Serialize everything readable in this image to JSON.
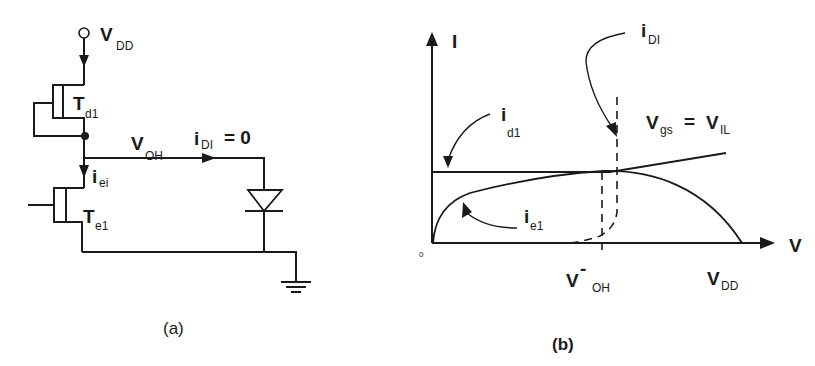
{
  "figure_a": {
    "caption": "(a)",
    "vdd": {
      "main": "V",
      "sub": "DD"
    },
    "td1": {
      "main": "T",
      "sub": "d1"
    },
    "te1": {
      "main": "T",
      "sub": "e1"
    },
    "iei": {
      "main": "i",
      "sub": "ei"
    },
    "voh": {
      "main": "V",
      "sub": "OH"
    },
    "idi_eq": {
      "main": "i",
      "sub": "DI",
      "rest": "=  0"
    }
  },
  "figure_b": {
    "caption": "(b)",
    "y_axis_label": "I",
    "x_axis_label": "V",
    "origin_label": "0",
    "id1": {
      "main": "i",
      "sub": "d1"
    },
    "ie1": {
      "main": "i",
      "sub": "e1"
    },
    "idi": {
      "main": "i",
      "sub": "DI"
    },
    "vgs": {
      "main": "V",
      "sub": "gs",
      "eq": "=",
      "rhs_main": "V",
      "rhs_sub": "IL"
    },
    "voh_minus": {
      "main": "V",
      "sup": "-",
      "sub": "OH"
    },
    "vdd": {
      "main": "V",
      "sub": "DD"
    }
  },
  "colors": {
    "ink": "#1a1a1a",
    "background": "#ffffff"
  }
}
